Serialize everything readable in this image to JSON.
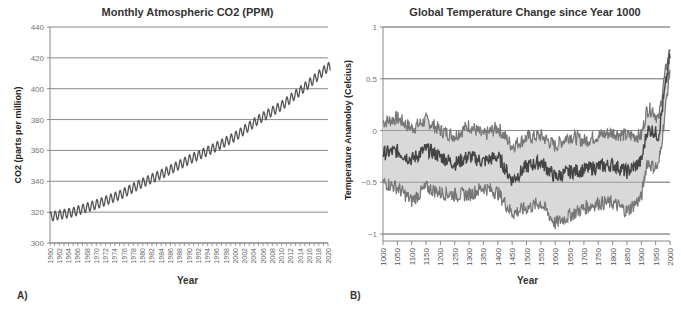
{
  "chart_data": [
    {
      "type": "line",
      "panel_label": "A)",
      "title": "Monthly Atmospheric CO2 (PPM)",
      "xlabel": "Year",
      "ylabel": "CO2 (parts per million)",
      "ylim": [
        300,
        440
      ],
      "yticks": [
        300,
        320,
        340,
        360,
        380,
        400,
        420,
        440
      ],
      "xlim": [
        1960,
        2020
      ],
      "xticks": [
        1960,
        1962,
        1964,
        1966,
        1968,
        1970,
        1972,
        1974,
        1976,
        1978,
        1980,
        1982,
        1984,
        1986,
        1988,
        1990,
        1992,
        1994,
        1996,
        1998,
        2000,
        2002,
        2004,
        2006,
        2008,
        2010,
        2012,
        2014,
        2016,
        2018,
        2020
      ],
      "grid": "horizontal",
      "legend": "none",
      "series": [
        {
          "name": "Monthly CO2",
          "color": "#555555",
          "seasonal_amplitude_ppm": 3,
          "x": [
            1960,
            1965,
            1970,
            1975,
            1980,
            1985,
            1990,
            1995,
            2000,
            2005,
            2010,
            2015,
            2020
          ],
          "values": [
            317,
            320,
            325,
            331,
            339,
            346,
            354,
            361,
            369,
            380,
            389,
            401,
            414
          ]
        }
      ]
    },
    {
      "type": "area",
      "panel_label": "B)",
      "title": "Global Temperature Change since Year 1000",
      "xlabel": "Year",
      "ylabel": "Temperature Anamoloy (Celcius)",
      "ylim": [
        -1,
        1
      ],
      "yticks": [
        -1,
        -0.5,
        0,
        0.5,
        1
      ],
      "ytick_labels": [
        "−1",
        "−0.5",
        "0",
        "0.5",
        "1"
      ],
      "xlim": [
        1000,
        2000
      ],
      "xticks": [
        1000,
        1050,
        1100,
        1150,
        1200,
        1250,
        1300,
        1350,
        1400,
        1450,
        1500,
        1550,
        1600,
        1650,
        1700,
        1750,
        1800,
        1850,
        1900,
        1950,
        2000
      ],
      "grid": "horizontal",
      "legend": "none",
      "band_fill": "#d9d9d9",
      "series": [
        {
          "name": "Upper uncertainty bound",
          "color": "#777777",
          "x": [
            1000,
            1050,
            1100,
            1150,
            1200,
            1250,
            1300,
            1350,
            1400,
            1450,
            1500,
            1550,
            1600,
            1650,
            1700,
            1750,
            1800,
            1850,
            1900,
            1920,
            1940,
            1960,
            1980,
            2000
          ],
          "values": [
            0.08,
            0.12,
            0.02,
            0.1,
            0.0,
            -0.05,
            0.05,
            -0.05,
            0.03,
            -0.15,
            -0.07,
            -0.05,
            -0.15,
            -0.05,
            -0.1,
            -0.05,
            -0.02,
            -0.05,
            -0.05,
            0.2,
            0.2,
            0.1,
            0.5,
            0.8
          ]
        },
        {
          "name": "Reconstructed mean",
          "color": "#444444",
          "x": [
            1000,
            1050,
            1100,
            1150,
            1200,
            1250,
            1300,
            1350,
            1400,
            1450,
            1500,
            1550,
            1600,
            1650,
            1700,
            1750,
            1800,
            1850,
            1900,
            1920,
            1940,
            1960,
            1980,
            2000
          ],
          "values": [
            -0.22,
            -0.2,
            -0.28,
            -0.18,
            -0.25,
            -0.32,
            -0.25,
            -0.3,
            -0.25,
            -0.48,
            -0.35,
            -0.3,
            -0.45,
            -0.4,
            -0.38,
            -0.35,
            -0.33,
            -0.4,
            -0.3,
            0.0,
            0.0,
            -0.05,
            0.35,
            0.72
          ]
        },
        {
          "name": "Lower uncertainty bound",
          "color": "#777777",
          "x": [
            1000,
            1050,
            1100,
            1150,
            1200,
            1250,
            1300,
            1350,
            1400,
            1450,
            1500,
            1550,
            1600,
            1650,
            1700,
            1750,
            1800,
            1850,
            1900,
            1920,
            1940,
            1960,
            1980,
            2000
          ],
          "values": [
            -0.5,
            -0.55,
            -0.68,
            -0.55,
            -0.6,
            -0.62,
            -0.62,
            -0.55,
            -0.6,
            -0.8,
            -0.75,
            -0.7,
            -0.9,
            -0.82,
            -0.75,
            -0.7,
            -0.7,
            -0.78,
            -0.65,
            -0.3,
            -0.35,
            -0.35,
            0.1,
            0.6
          ]
        }
      ]
    }
  ]
}
